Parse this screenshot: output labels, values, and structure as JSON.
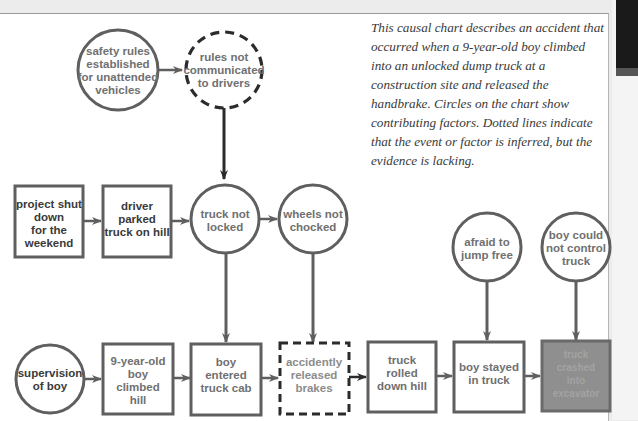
{
  "caption": "This causal chart describes an accident that occurred when a 9-year-old boy climbed into an unlocked dump truck at a construction site and released the handbrake. Circles on the chart show contributing factors. Dotted lines indicate that the event or factor is inferred, but the evidence is lacking.",
  "colors": {
    "stroke": "#5f5f5f",
    "dashed_stroke": "#2b2b2b",
    "text": "#707070",
    "final_box_fill": "#8f8f8f",
    "background": "#ffffff"
  },
  "legend": {
    "circle": "contributing factor",
    "box": "event",
    "dashed": "inferred, evidence lacking"
  },
  "nodes": {
    "safety_rules": {
      "shape": "circle",
      "style": "solid",
      "lines": [
        "safety rules",
        "established",
        "for unattended",
        "vehicles"
      ]
    },
    "rules_not_communicated": {
      "shape": "circle",
      "style": "dashed",
      "lines": [
        "rules not",
        "communicated",
        "to drivers"
      ]
    },
    "project_shut_down": {
      "shape": "box",
      "style": "solid",
      "lines": [
        "project shut",
        "down",
        "for the",
        "weekend"
      ]
    },
    "driver_parked": {
      "shape": "box",
      "style": "solid",
      "lines": [
        "driver",
        "parked",
        "truck on hill"
      ]
    },
    "truck_not_locked": {
      "shape": "circle",
      "style": "solid",
      "lines": [
        "truck not",
        "locked"
      ]
    },
    "wheels_not_chocked": {
      "shape": "circle",
      "style": "solid",
      "lines": [
        "wheels not",
        "chocked"
      ]
    },
    "afraid_to_jump": {
      "shape": "circle",
      "style": "solid",
      "lines": [
        "afraid to",
        "jump free"
      ]
    },
    "boy_could_not_control": {
      "shape": "circle",
      "style": "solid",
      "lines": [
        "boy could",
        "not control",
        "truck"
      ]
    },
    "supervision_of_boy": {
      "shape": "circle",
      "style": "solid",
      "lines": [
        "supervision",
        "of boy"
      ]
    },
    "boy_climbed_hill": {
      "shape": "box",
      "style": "solid",
      "lines": [
        "9-year-old",
        "boy",
        "climbed",
        "hill"
      ]
    },
    "boy_entered_cab": {
      "shape": "box",
      "style": "solid",
      "lines": [
        "boy",
        "entered",
        "truck cab"
      ]
    },
    "accidently_released_brakes": {
      "shape": "box",
      "style": "dashed",
      "lines": [
        "accidently",
        "released",
        "brakes"
      ]
    },
    "truck_rolled": {
      "shape": "box",
      "style": "solid",
      "lines": [
        "truck",
        "rolled",
        "down hill"
      ]
    },
    "boy_stayed": {
      "shape": "box",
      "style": "solid",
      "lines": [
        "boy stayed",
        "in truck"
      ]
    },
    "truck_crashed": {
      "shape": "box",
      "style": "filled",
      "lines": [
        "truck",
        "crashed",
        "into",
        "excavator"
      ]
    }
  },
  "edges": [
    [
      "safety_rules",
      "rules_not_communicated"
    ],
    [
      "rules_not_communicated",
      "truck_not_locked"
    ],
    [
      "project_shut_down",
      "driver_parked"
    ],
    [
      "driver_parked",
      "truck_not_locked"
    ],
    [
      "truck_not_locked",
      "wheels_not_chocked"
    ],
    [
      "truck_not_locked",
      "boy_entered_cab"
    ],
    [
      "wheels_not_chocked",
      "accidently_released_brakes"
    ],
    [
      "supervision_of_boy",
      "boy_climbed_hill"
    ],
    [
      "boy_climbed_hill",
      "boy_entered_cab"
    ],
    [
      "boy_entered_cab",
      "accidently_released_brakes"
    ],
    [
      "accidently_released_brakes",
      "truck_rolled"
    ],
    [
      "truck_rolled",
      "boy_stayed"
    ],
    [
      "afraid_to_jump",
      "boy_stayed"
    ],
    [
      "boy_stayed",
      "truck_crashed"
    ],
    [
      "boy_could_not_control",
      "truck_crashed"
    ]
  ]
}
